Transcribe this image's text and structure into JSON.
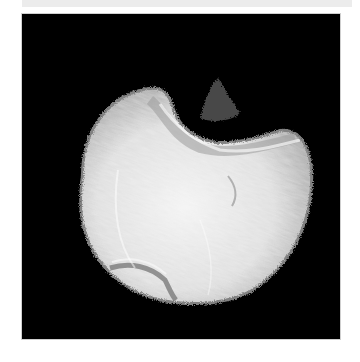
{
  "image": {
    "subject": "pale textured lobed specimen on black background",
    "background_color": "#000000",
    "page_color": "#ffffff",
    "specimen_color": "#e6e6e6",
    "frame": {
      "x": 22,
      "y": 14,
      "width": 318,
      "height": 325
    }
  }
}
